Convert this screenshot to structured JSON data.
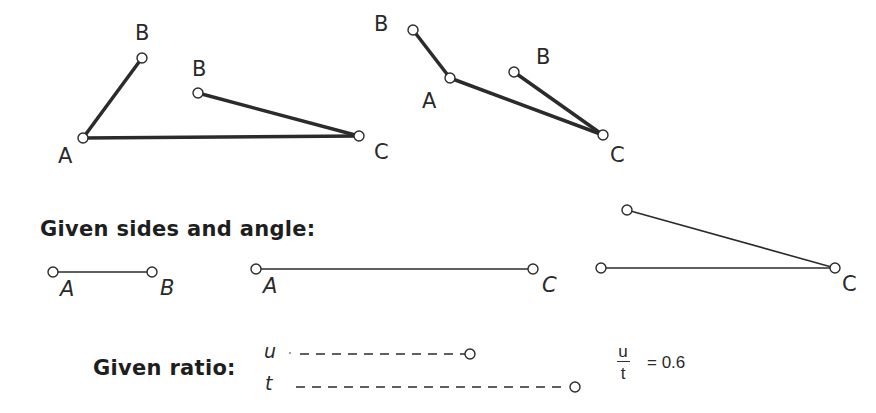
{
  "figure1": {
    "labels": {
      "B_top": "B",
      "A": "A",
      "B_mid": "B",
      "C": "C"
    },
    "points": {
      "B_top": [
        142,
        58
      ],
      "A": [
        83,
        138
      ],
      "B_mid": [
        198,
        93
      ],
      "C": [
        359,
        136
      ]
    }
  },
  "figure2": {
    "labels": {
      "B_top": "B",
      "A": "A",
      "B_mid": "B",
      "C": "C"
    },
    "points": {
      "B_top": [
        413,
        30
      ],
      "A": [
        450,
        78
      ],
      "B_mid": [
        514,
        72
      ],
      "C": [
        603,
        135
      ]
    }
  },
  "given_sides": {
    "heading": "Given sides and angle:",
    "segment_ab": {
      "label_start": "A",
      "label_end": "B",
      "from": [
        53,
        272
      ],
      "to": [
        152,
        272
      ]
    },
    "segment_ac": {
      "label_start": "A",
      "label_end": "C",
      "from": [
        256,
        269
      ],
      "to": [
        533,
        269
      ]
    },
    "angle": {
      "label_vertex": "C",
      "ray1_end": [
        627,
        210
      ],
      "ray2_end": [
        601,
        268
      ],
      "vertex": [
        835,
        268
      ]
    }
  },
  "given_ratio": {
    "heading": "Given ratio:",
    "u": {
      "label": "u",
      "start": [
        283,
        354
      ],
      "end": [
        470,
        354
      ]
    },
    "t": {
      "label": "t",
      "start": [
        282,
        387
      ],
      "end": [
        575,
        387
      ]
    },
    "fraction": {
      "numerator": "u",
      "denominator": "t"
    },
    "equals": "= 0.6"
  },
  "colors": {
    "stroke": "#2b2b2b",
    "background": "#ffffff"
  }
}
